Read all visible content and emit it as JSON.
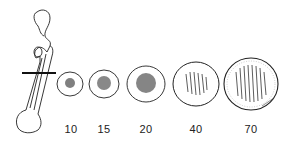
{
  "figure": {
    "sections": [
      {
        "label": "10",
        "cx": 70,
        "cy": 84,
        "rx": 13,
        "ry": 12
      },
      {
        "label": "15",
        "cx": 104,
        "cy": 84,
        "rx": 15,
        "ry": 14
      },
      {
        "label": "20",
        "cx": 146,
        "cy": 84,
        "rx": 19,
        "ry": 18
      },
      {
        "label": "40",
        "cx": 196,
        "cy": 84,
        "rx": 23,
        "ry": 22
      },
      {
        "label": "70",
        "cx": 251,
        "cy": 84,
        "rx": 27,
        "ry": 26
      }
    ],
    "colors": {
      "line": "#222222",
      "background": "#ffffff"
    }
  }
}
